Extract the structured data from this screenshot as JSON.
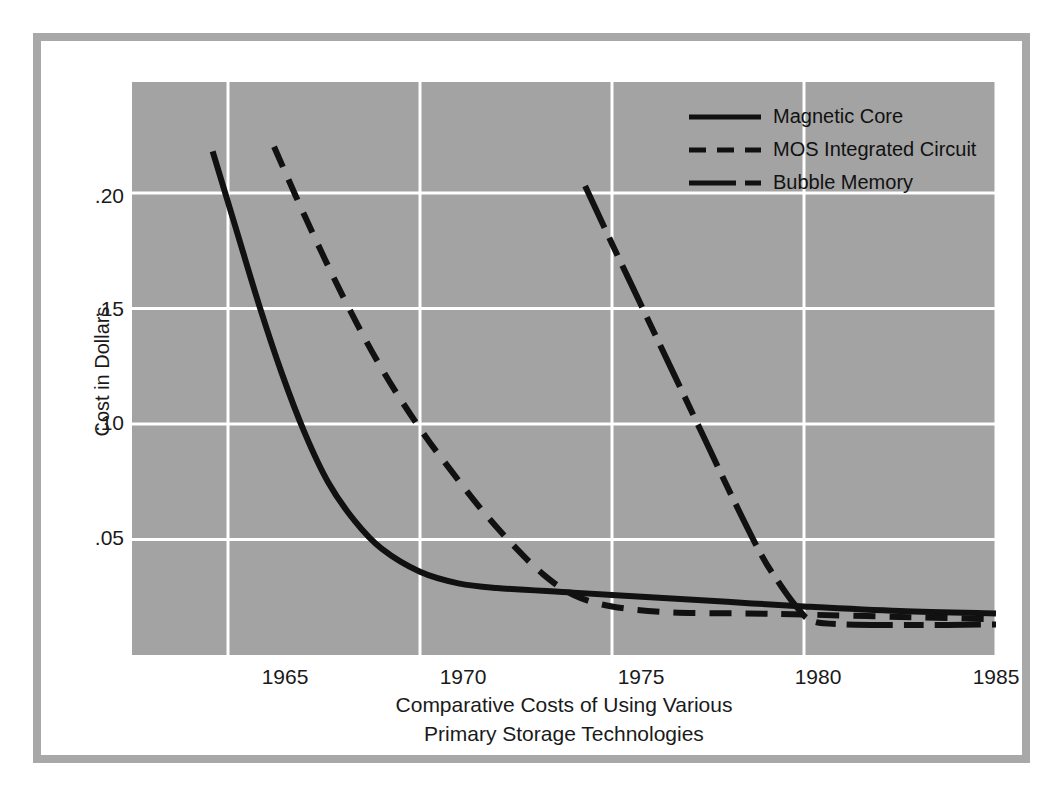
{
  "figure": {
    "caption_line1": "Comparative Costs of Using Various",
    "caption_line2": "Primary Storage Technologies",
    "frame_color": "#a8a8a8",
    "plot_bg_color": "#a3a3a3",
    "grid_color": "#ffffff",
    "line_color": "#111111"
  },
  "legend": {
    "items": [
      {
        "label": "Magnetic Core",
        "style": "solid",
        "name": "legend-magnetic-core"
      },
      {
        "label": "MOS Integrated Circuit",
        "style": "dashed",
        "name": "legend-mos-integrated-circuit"
      },
      {
        "label": "Bubble Memory",
        "style": "long-dash-short-dash",
        "name": "legend-bubble-memory"
      }
    ]
  },
  "chart_data": {
    "type": "line",
    "title": "Comparative Costs of Using Various Primary Storage Technologies",
    "xlabel": "",
    "ylabel": "Cost in Dollars",
    "xlim": [
      1962.5,
      1985
    ],
    "ylim": [
      0.0,
      0.248
    ],
    "xticks": [
      1965,
      1970,
      1975,
      1980,
      1985
    ],
    "xtick_labels": [
      "1965",
      "1970",
      "1975",
      "1980",
      "1985"
    ],
    "yticks": [
      0.05,
      0.1,
      0.15,
      0.2
    ],
    "ytick_labels": [
      ".05",
      ".10",
      ".15",
      ".20"
    ],
    "grid": true,
    "legend_position": "top-right",
    "series": [
      {
        "name": "Magnetic Core",
        "style": "solid",
        "points": [
          {
            "x": 1964.6,
            "y": 0.218
          },
          {
            "x": 1965.2,
            "y": 0.185
          },
          {
            "x": 1965.8,
            "y": 0.152
          },
          {
            "x": 1966.4,
            "y": 0.122
          },
          {
            "x": 1967.0,
            "y": 0.096
          },
          {
            "x": 1967.6,
            "y": 0.075
          },
          {
            "x": 1968.3,
            "y": 0.058
          },
          {
            "x": 1969.0,
            "y": 0.046
          },
          {
            "x": 1970.0,
            "y": 0.036
          },
          {
            "x": 1971.0,
            "y": 0.031
          },
          {
            "x": 1972.0,
            "y": 0.029
          },
          {
            "x": 1974.0,
            "y": 0.027
          },
          {
            "x": 1976.0,
            "y": 0.025
          },
          {
            "x": 1978.0,
            "y": 0.023
          },
          {
            "x": 1980.0,
            "y": 0.021
          },
          {
            "x": 1982.5,
            "y": 0.019
          },
          {
            "x": 1985.0,
            "y": 0.018
          }
        ]
      },
      {
        "name": "MOS Integrated Circuit",
        "style": "dashed",
        "points": [
          {
            "x": 1966.2,
            "y": 0.22
          },
          {
            "x": 1967.0,
            "y": 0.19
          },
          {
            "x": 1968.0,
            "y": 0.155
          },
          {
            "x": 1969.0,
            "y": 0.124
          },
          {
            "x": 1970.0,
            "y": 0.098
          },
          {
            "x": 1970.8,
            "y": 0.08
          },
          {
            "x": 1971.6,
            "y": 0.063
          },
          {
            "x": 1972.4,
            "y": 0.048
          },
          {
            "x": 1973.2,
            "y": 0.035
          },
          {
            "x": 1974.0,
            "y": 0.026
          },
          {
            "x": 1975.0,
            "y": 0.021
          },
          {
            "x": 1976.5,
            "y": 0.0185
          },
          {
            "x": 1978.5,
            "y": 0.018
          },
          {
            "x": 1980.0,
            "y": 0.0175
          },
          {
            "x": 1982.5,
            "y": 0.0165
          },
          {
            "x": 1985.0,
            "y": 0.0155
          }
        ]
      },
      {
        "name": "Bubble Memory",
        "style": "long-dash-short-dash",
        "points": [
          {
            "x": 1974.3,
            "y": 0.203
          },
          {
            "x": 1975.0,
            "y": 0.178
          },
          {
            "x": 1975.8,
            "y": 0.15
          },
          {
            "x": 1976.6,
            "y": 0.122
          },
          {
            "x": 1977.4,
            "y": 0.094
          },
          {
            "x": 1978.2,
            "y": 0.066
          },
          {
            "x": 1978.9,
            "y": 0.043
          },
          {
            "x": 1979.4,
            "y": 0.03
          },
          {
            "x": 1979.8,
            "y": 0.021
          },
          {
            "x": 1980.2,
            "y": 0.0148
          },
          {
            "x": 1981.0,
            "y": 0.0133
          },
          {
            "x": 1983.0,
            "y": 0.013
          },
          {
            "x": 1985.0,
            "y": 0.0132
          }
        ]
      }
    ]
  }
}
